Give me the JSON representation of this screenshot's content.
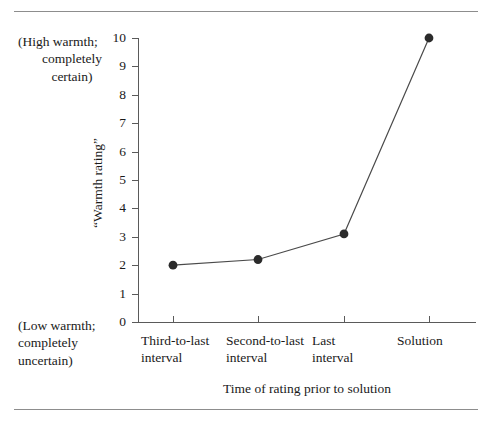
{
  "chart_data": {
    "type": "line",
    "title": "",
    "categories": [
      "Third-to-last\ninterval",
      "Second-to-last\ninterval",
      "Last\ninterval",
      "Solution"
    ],
    "values": [
      2.0,
      2.2,
      3.1,
      10.0
    ],
    "series": [
      {
        "name": "“Warmth rating”",
        "values": [
          2.0,
          2.2,
          3.1,
          10.0
        ]
      }
    ],
    "xlabel": "Time of rating prior to solution",
    "ylabel": "“Warmth rating”",
    "ylim": [
      0,
      10
    ],
    "ytick_labels": [
      "0",
      "1",
      "2",
      "3",
      "4",
      "5",
      "6",
      "7",
      "8",
      "9",
      "10"
    ],
    "ytick_values": [
      0,
      1,
      2,
      3,
      4,
      5,
      6,
      7,
      8,
      9,
      10
    ],
    "grid": false,
    "legend": "none",
    "marker": "filled-circle",
    "line_color": "#4a4a4a",
    "marker_color": "#2b2b2b",
    "axis_color": "#5a5a5a",
    "annotations": {
      "high_anchor": {
        "line1": "(High warmth;",
        "line2": "completely",
        "line3": "certain)",
        "at_value": 10
      },
      "low_anchor": {
        "line1": "(Low warmth;",
        "line2": "completely",
        "line3": "uncertain)",
        "at_value": 0
      }
    }
  }
}
